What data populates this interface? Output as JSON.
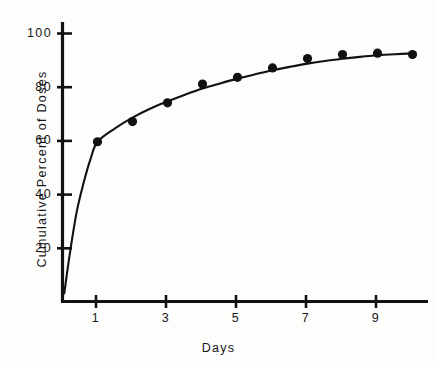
{
  "chart_data": {
    "type": "scatter",
    "title": "",
    "xlabel": "Days",
    "ylabel": "Cumulative Percent of Doses",
    "x": [
      1,
      2,
      3,
      4,
      5,
      6,
      7,
      8,
      9,
      10
    ],
    "values": [
      59.5,
      67,
      74,
      81,
      83.5,
      87,
      90.5,
      92,
      92.5,
      92
    ],
    "series": [
      {
        "name": "Cumulative Percent of Doses",
        "x": [
          1,
          2,
          3,
          4,
          5,
          6,
          7,
          8,
          9,
          10
        ],
        "values": [
          59.5,
          67,
          74,
          81,
          83.5,
          87,
          90.5,
          92,
          92.5,
          92
        ]
      }
    ],
    "fit_curve": {
      "description": "smooth rising saturating curve through the data points",
      "x": [
        0.05,
        0.2,
        0.4,
        0.6,
        0.8,
        1.0,
        1.5,
        2.0,
        2.5,
        3.0,
        3.5,
        4.0,
        4.5,
        5.0,
        5.5,
        6.0,
        6.5,
        7.0,
        7.5,
        8.0,
        8.5,
        9.0,
        9.5,
        10.0
      ],
      "values": [
        3,
        17,
        33,
        44,
        53,
        59.5,
        64.5,
        68.5,
        71.8,
        74.5,
        77.0,
        79.3,
        81.2,
        83.0,
        84.6,
        86.1,
        87.4,
        88.6,
        89.6,
        90.4,
        91.1,
        91.7,
        92.1,
        92.4
      ]
    },
    "xlim": [
      0,
      10.6
    ],
    "ylim": [
      0,
      103
    ],
    "xticks": [
      1,
      3,
      5,
      7,
      9
    ],
    "xtick_labels": [
      "1",
      "3",
      "5",
      "7",
      "9"
    ],
    "yticks": [
      20,
      40,
      60,
      80,
      100
    ],
    "ytick_labels": [
      "20",
      "40",
      "60",
      "80",
      "100"
    ],
    "grid": false,
    "legend": "none",
    "marker": "filled-circle",
    "marker_color": "#111111",
    "line_color": "#111111",
    "axis_color": "#111111",
    "background": "#fdfdfc"
  }
}
